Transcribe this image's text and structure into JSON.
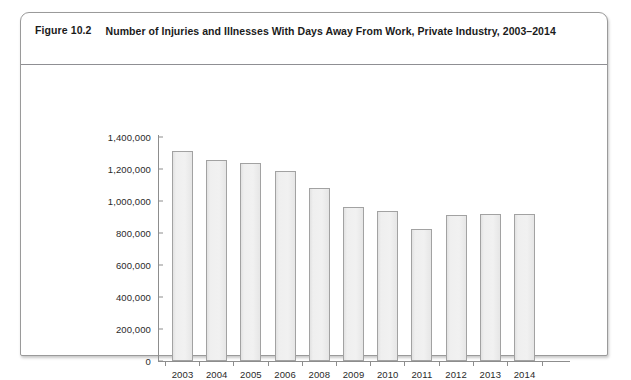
{
  "figure": {
    "label": "Figure 10.2",
    "title": "Number of Injuries and Illnesses With Days Away From Work, Private Industry, 2003–2014"
  },
  "chart_data": {
    "type": "bar",
    "title": "Number of Injuries and Illnesses With Days Away From Work, Private Industry, 2003–2014",
    "xlabel": "",
    "ylabel": "",
    "categories": [
      "2003",
      "2004",
      "2005",
      "2006",
      "2008",
      "2009",
      "2010",
      "2011",
      "2012",
      "2013",
      "2014"
    ],
    "values": [
      1310000,
      1255000,
      1240000,
      1185000,
      1080000,
      965000,
      935000,
      825000,
      910000,
      918000,
      917000
    ],
    "ylim": [
      0,
      1400000
    ],
    "ytick_values": [
      0,
      200000,
      400000,
      600000,
      800000,
      1000000,
      1200000,
      1400000
    ],
    "ytick_labels": [
      "0",
      "200,000",
      "400,000",
      "600,000",
      "800,000",
      "1,000,000",
      "1,200,000",
      "1,400,000"
    ],
    "grid": false,
    "legend": false,
    "bar_fill_color": "#ececec",
    "bar_border_color": "#a2a2a2",
    "axis_color": "#8d8d8d"
  }
}
